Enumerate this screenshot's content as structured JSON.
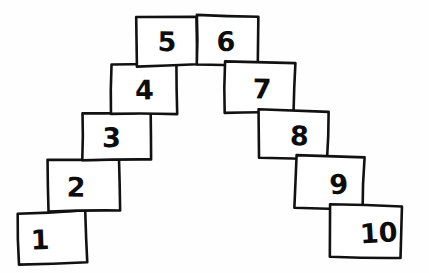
{
  "figure": {
    "background_color": "#fefefe",
    "ink_color": "#111111",
    "box_fill_color": "#ffffff"
  },
  "chart_data": {
    "type": "diagram",
    "xlabel": "",
    "ylabel": "",
    "count": 10,
    "boxes": [
      {
        "label": "1",
        "step": 1,
        "side": "left",
        "x": 18,
        "y": 212,
        "width": 68,
        "height": 51,
        "rotation": -1.5,
        "label_dx": -12,
        "label_dy": 4,
        "font_size": 27
      },
      {
        "label": "2",
        "step": 2,
        "side": "left",
        "x": 49,
        "y": 160,
        "width": 70,
        "height": 52,
        "rotation": -1.2,
        "label_dx": -8,
        "label_dy": 3,
        "font_size": 27
      },
      {
        "label": "3",
        "step": 3,
        "side": "left",
        "x": 82,
        "y": 112,
        "width": 69,
        "height": 49,
        "rotation": -1.0,
        "label_dx": -5,
        "label_dy": 3,
        "font_size": 27
      },
      {
        "label": "4",
        "step": 4,
        "side": "left",
        "x": 111,
        "y": 64,
        "width": 65,
        "height": 50,
        "rotation": -1.2,
        "label_dx": 1,
        "label_dy": 3,
        "font_size": 27
      },
      {
        "label": "5",
        "step": 5,
        "side": "left",
        "x": 137,
        "y": 16,
        "width": 60,
        "height": 49,
        "rotation": -0.8,
        "label_dx": 0,
        "label_dy": 3,
        "font_size": 27
      },
      {
        "label": "6",
        "step": 6,
        "side": "right",
        "x": 196,
        "y": 16,
        "width": 62,
        "height": 49,
        "rotation": 0.6,
        "label_dx": -1,
        "label_dy": 3,
        "font_size": 27
      },
      {
        "label": "7",
        "step": 7,
        "side": "right",
        "x": 225,
        "y": 63,
        "width": 70,
        "height": 50,
        "rotation": 0.9,
        "label_dx": 2,
        "label_dy": 3,
        "font_size": 27
      },
      {
        "label": "8",
        "step": 8,
        "side": "right",
        "x": 259,
        "y": 110,
        "width": 69,
        "height": 49,
        "rotation": 1.2,
        "label_dx": 6,
        "label_dy": 3,
        "font_size": 27
      },
      {
        "label": "9",
        "step": 9,
        "side": "right",
        "x": 295,
        "y": 157,
        "width": 68,
        "height": 52,
        "rotation": 1.4,
        "label_dx": 10,
        "label_dy": 3,
        "font_size": 27
      },
      {
        "label": "10",
        "step": 10,
        "side": "right",
        "x": 330,
        "y": 205,
        "width": 72,
        "height": 53,
        "rotation": 1.6,
        "label_dx": 13,
        "label_dy": 3,
        "font_size": 27
      }
    ]
  }
}
